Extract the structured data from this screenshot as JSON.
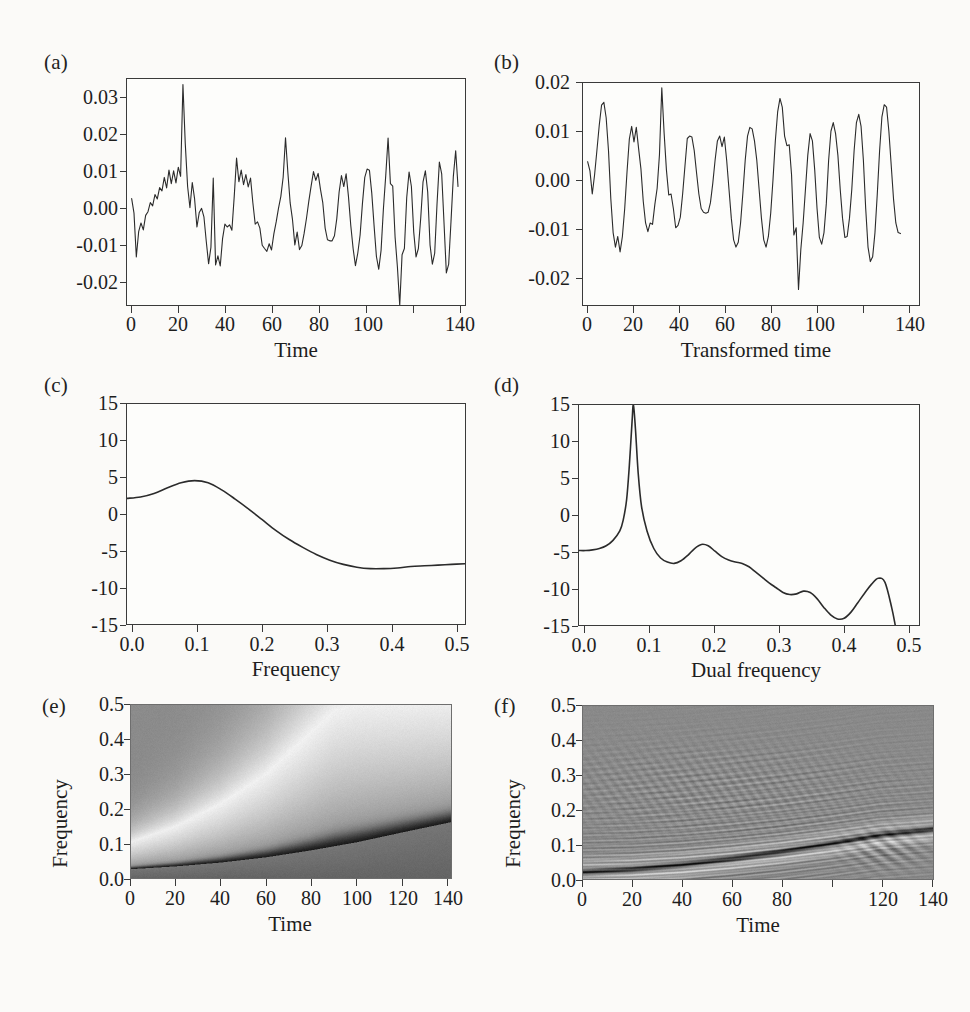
{
  "figure": {
    "background": "#fbfaf8",
    "ink": "#2a2a2a",
    "panel_count": 6
  },
  "panels": {
    "a": {
      "label": "(a)",
      "xlabel": "Time",
      "ylabel": "",
      "xticks": [
        "0",
        "20",
        "40",
        "60",
        "80",
        "100",
        "140"
      ],
      "yticks": [
        "0.03",
        "0.02",
        "0.01",
        "0.00",
        "-0.01",
        "-0.02"
      ]
    },
    "b": {
      "label": "(b)",
      "xlabel": "Transformed time",
      "ylabel": "",
      "xticks": [
        "0",
        "20",
        "40",
        "60",
        "80",
        "100",
        "140"
      ],
      "yticks": [
        "0.02",
        "0.01",
        "0.00",
        "-0.01",
        "-0.02"
      ]
    },
    "c": {
      "label": "(c)",
      "xlabel": "Frequency",
      "ylabel": "",
      "xticks": [
        "0.0",
        "0.1",
        "0.2",
        "0.3",
        "0.4",
        "0.5"
      ],
      "yticks": [
        "15",
        "10",
        "5",
        "0",
        "-5",
        "-10",
        "-15"
      ]
    },
    "d": {
      "label": "(d)",
      "xlabel": "Dual frequency",
      "ylabel": "",
      "xticks": [
        "0.0",
        "0.1",
        "0.2",
        "0.3",
        "0.4",
        "0.5"
      ],
      "yticks": [
        "15",
        "10",
        "5",
        "0",
        "-5",
        "-10",
        "-15"
      ]
    },
    "e": {
      "label": "(e)",
      "xlabel": "Time",
      "ylabel": "Frequency",
      "xticks": [
        "0",
        "20",
        "40",
        "60",
        "80",
        "100",
        "120",
        "140"
      ],
      "yticks": [
        "0.5",
        "0.4",
        "0.3",
        "0.2",
        "0.1",
        "0.0"
      ]
    },
    "f": {
      "label": "(f)",
      "xlabel": "Time",
      "ylabel": "Frequency",
      "xticks": [
        "0",
        "20",
        "40",
        "60",
        "80",
        "100",
        "120",
        "140"
      ],
      "yticks": [
        "0.5",
        "0.4",
        "0.3",
        "0.2",
        "0.1",
        "0.0"
      ]
    }
  },
  "chart_data": [
    {
      "panel": "a",
      "type": "line",
      "title": "(a)",
      "xlabel": "Time",
      "ylabel": "",
      "xlim": [
        0,
        145
      ],
      "ylim": [
        -0.026,
        0.036
      ],
      "grid": false,
      "legend": "none",
      "x": [
        2,
        3,
        4,
        5,
        6,
        7,
        8,
        9,
        10,
        11,
        12,
        13,
        14,
        15,
        16,
        17,
        18,
        19,
        20,
        21,
        22,
        23,
        24,
        25,
        26,
        27,
        28,
        29,
        30,
        31,
        32,
        33,
        34,
        35,
        36,
        37,
        38,
        39,
        40,
        41,
        42,
        43,
        44,
        45,
        46,
        47,
        48,
        49,
        50,
        51,
        52,
        53,
        54,
        55,
        56,
        57,
        58,
        59,
        60,
        61,
        62,
        63,
        64,
        65,
        66,
        67,
        68,
        69,
        70,
        71,
        72,
        73,
        74,
        75,
        76,
        77,
        78,
        79,
        80,
        81,
        82,
        83,
        84,
        85,
        86,
        87,
        88,
        89,
        90,
        91,
        92,
        93,
        94,
        95,
        96,
        97,
        98,
        99,
        100,
        101,
        102,
        103,
        104,
        105,
        106,
        107,
        108,
        109,
        110,
        111,
        112,
        113,
        114,
        115,
        116,
        117,
        118,
        119,
        120,
        121,
        122,
        123,
        124,
        125,
        126,
        127,
        128,
        129,
        130,
        131,
        132,
        133,
        134,
        135,
        136,
        137,
        138,
        139,
        140,
        141,
        142
      ],
      "y": [
        0.0032,
        -0.0008,
        -0.0128,
        -0.0059,
        -0.0035,
        -0.0054,
        -0.0014,
        -0.0004,
        0.0021,
        0.0012,
        0.0043,
        0.0031,
        0.0062,
        0.0053,
        0.009,
        0.0061,
        0.011,
        0.0073,
        0.0108,
        0.0075,
        0.0118,
        0.0093,
        0.0345,
        0.0182,
        0.0065,
        0.0007,
        0.0076,
        0.0031,
        -0.0046,
        -0.0006,
        0.0005,
        -0.0018,
        -0.0085,
        -0.0147,
        -0.0102,
        0.0088,
        -0.015,
        -0.0125,
        -0.0153,
        -0.0078,
        -0.0038,
        -0.0046,
        -0.004,
        -0.0055,
        0.0038,
        0.0143,
        0.0078,
        0.011,
        0.007,
        0.0098,
        0.0064,
        0.0088,
        0.002,
        -0.0038,
        -0.0032,
        -0.0049,
        -0.0096,
        -0.0105,
        -0.0113,
        -0.0092,
        -0.0109,
        -0.0065,
        -0.0032,
        0.0006,
        0.0038,
        0.0091,
        0.0199,
        0.0104,
        0.002,
        -0.0026,
        -0.0095,
        -0.006,
        -0.0108,
        -0.0097,
        -0.0063,
        -0.0022,
        0.0025,
        0.0067,
        0.0106,
        0.0082,
        0.0101,
        0.0057,
        0.002,
        -0.0049,
        -0.0081,
        -0.0084,
        -0.0084,
        -0.007,
        -0.0023,
        0.005,
        0.0095,
        0.0065,
        0.01,
        0.0038,
        -0.0042,
        -0.0105,
        -0.0152,
        -0.0118,
        -0.0068,
        0.0018,
        0.009,
        0.0113,
        0.011,
        0.0047,
        -0.0043,
        -0.0127,
        -0.0162,
        -0.011,
        0.0004,
        0.0095,
        0.0198,
        0.0073,
        0.0066,
        -0.0073,
        -0.0155,
        -0.0261,
        -0.0122,
        -0.0105,
        0.0035,
        0.0105,
        0.0065,
        -0.006,
        -0.0128,
        -0.0105,
        -0.0022,
        0.0078,
        0.0108,
        0.005,
        -0.0095,
        -0.0148,
        -0.0118,
        0.0018,
        0.0132,
        0.01,
        -0.0035,
        -0.0172,
        -0.0148,
        -0.003,
        0.0093,
        0.0163,
        0.0065,
        -0.0115
      ]
    },
    {
      "panel": "b",
      "type": "line",
      "title": "(b)",
      "xlabel": "Transformed time",
      "ylabel": "",
      "xlim": [
        0,
        145
      ],
      "ylim": [
        -0.026,
        0.02
      ],
      "grid": false,
      "legend": "none",
      "x": [
        2,
        3,
        4,
        5,
        6,
        7,
        8,
        9,
        10,
        11,
        12,
        13,
        14,
        15,
        16,
        17,
        18,
        19,
        20,
        21,
        22,
        23,
        24,
        25,
        26,
        27,
        28,
        29,
        30,
        31,
        32,
        33,
        34,
        35,
        36,
        37,
        38,
        39,
        40,
        41,
        42,
        43,
        44,
        45,
        46,
        47,
        48,
        49,
        50,
        51,
        52,
        53,
        54,
        55,
        56,
        57,
        58,
        59,
        60,
        61,
        62,
        63,
        64,
        65,
        66,
        67,
        68,
        69,
        70,
        71,
        72,
        73,
        74,
        75,
        76,
        77,
        78,
        79,
        80,
        81,
        82,
        83,
        84,
        85,
        86,
        87,
        88,
        89,
        90,
        91,
        92,
        93,
        94,
        95,
        96,
        97,
        98,
        99,
        100,
        101,
        102,
        103,
        104,
        105,
        106,
        107,
        108,
        109,
        110,
        111,
        112,
        113,
        114,
        115,
        116,
        117,
        118,
        119,
        120,
        121,
        122,
        123,
        124,
        125,
        126,
        127,
        128,
        129,
        130,
        131,
        132,
        133,
        134,
        135,
        136,
        137,
        138,
        139,
        140,
        141,
        142
      ],
      "y": [
        0.0037,
        0.0018,
        -0.003,
        0.001,
        0.006,
        0.0112,
        0.0154,
        0.016,
        0.0128,
        0.006,
        -0.004,
        -0.011,
        -0.014,
        -0.0118,
        -0.015,
        -0.0118,
        -0.006,
        0.0016,
        0.0084,
        0.011,
        0.0078,
        0.0108,
        0.0064,
        0.0022,
        -0.0045,
        -0.009,
        -0.0108,
        -0.009,
        -0.0093,
        -0.0052,
        -0.0018,
        0.0052,
        0.019,
        0.0097,
        0.002,
        -0.0032,
        -0.003,
        -0.006,
        -0.01,
        -0.0095,
        -0.0078,
        -0.003,
        0.0028,
        0.0085,
        0.009,
        0.0088,
        0.006,
        0.0014,
        -0.003,
        -0.006,
        -0.0068,
        -0.007,
        -0.0068,
        -0.0048,
        -0.0008,
        0.004,
        0.008,
        0.009,
        0.0068,
        0.0088,
        0.004,
        -0.002,
        -0.008,
        -0.0125,
        -0.014,
        -0.013,
        -0.009,
        -0.0028,
        0.004,
        0.009,
        0.0108,
        0.0105,
        0.008,
        0.004,
        -0.002,
        -0.008,
        -0.0125,
        -0.014,
        -0.0118,
        -0.007,
        0.0,
        0.008,
        0.014,
        0.0168,
        0.015,
        0.009,
        0.007,
        0.0072,
        0.001,
        -0.0115,
        -0.01,
        -0.0228,
        -0.0145,
        -0.009,
        -0.002,
        0.005,
        0.0095,
        0.008,
        0.002,
        -0.006,
        -0.012,
        -0.0134,
        -0.011,
        -0.005,
        0.004,
        0.01,
        0.0118,
        0.0095,
        0.005,
        -0.002,
        -0.008,
        -0.012,
        -0.0118,
        -0.008,
        -0.002,
        0.006,
        0.0118,
        0.0135,
        0.011,
        0.004,
        -0.006,
        -0.014,
        -0.017,
        -0.016,
        -0.011,
        -0.003,
        0.006,
        0.013,
        0.0155,
        0.015,
        0.01,
        0.003,
        -0.004,
        -0.009,
        -0.011,
        -0.0112
      ]
    },
    {
      "panel": "c",
      "type": "line",
      "title": "(c)",
      "xlabel": "Frequency",
      "ylabel": "",
      "xlim": [
        0.0,
        0.5
      ],
      "ylim": [
        -15,
        16
      ],
      "grid": false,
      "legend": "none",
      "x": [
        0.0,
        0.02,
        0.04,
        0.06,
        0.08,
        0.1,
        0.12,
        0.14,
        0.16,
        0.18,
        0.2,
        0.22,
        0.24,
        0.26,
        0.28,
        0.3,
        0.32,
        0.34,
        0.36,
        0.38,
        0.4,
        0.42,
        0.44,
        0.46,
        0.48,
        0.5
      ],
      "y": [
        2.7,
        2.9,
        3.4,
        4.2,
        4.9,
        5.2,
        4.9,
        3.9,
        2.6,
        1.2,
        -0.3,
        -1.8,
        -3.1,
        -4.2,
        -5.2,
        -6.0,
        -6.6,
        -7.0,
        -7.2,
        -7.2,
        -7.1,
        -6.9,
        -6.8,
        -6.7,
        -6.6,
        -6.5
      ]
    },
    {
      "panel": "d",
      "type": "line",
      "title": "(d)",
      "xlabel": "Dual frequency",
      "ylabel": "",
      "xlim": [
        0.0,
        0.5
      ],
      "ylim": [
        -16.5,
        16
      ],
      "grid": false,
      "legend": "none",
      "x": [
        0.0,
        0.01,
        0.02,
        0.03,
        0.04,
        0.05,
        0.06,
        0.065,
        0.07,
        0.074,
        0.078,
        0.08,
        0.083,
        0.087,
        0.092,
        0.1,
        0.11,
        0.12,
        0.13,
        0.14,
        0.15,
        0.16,
        0.17,
        0.18,
        0.19,
        0.2,
        0.21,
        0.22,
        0.23,
        0.24,
        0.25,
        0.26,
        0.27,
        0.28,
        0.29,
        0.3,
        0.31,
        0.32,
        0.33,
        0.34,
        0.35,
        0.36,
        0.37,
        0.38,
        0.39,
        0.4,
        0.41,
        0.42,
        0.43,
        0.44,
        0.45,
        0.46,
        0.465
      ],
      "y": [
        -5.5,
        -5.5,
        -5.4,
        -5.2,
        -4.8,
        -4.0,
        -2.6,
        -1.0,
        2.0,
        7.0,
        13.5,
        16.0,
        12.5,
        6.0,
        1.0,
        -2.6,
        -5.2,
        -6.6,
        -7.2,
        -7.4,
        -7.0,
        -6.2,
        -5.2,
        -4.6,
        -4.8,
        -5.6,
        -6.4,
        -6.9,
        -7.2,
        -7.4,
        -7.9,
        -8.7,
        -9.5,
        -10.3,
        -11.0,
        -11.7,
        -12.0,
        -11.9,
        -11.5,
        -11.7,
        -12.6,
        -13.9,
        -15.0,
        -15.6,
        -15.5,
        -14.6,
        -13.2,
        -11.8,
        -10.5,
        -9.6,
        -10.2,
        -14.0,
        -16.5
      ]
    },
    {
      "panel": "e",
      "type": "heatmap",
      "title": "(e)",
      "xlabel": "Time",
      "ylabel": "Frequency",
      "xlim": [
        0,
        142
      ],
      "ylim": [
        0.0,
        0.5
      ],
      "colormap": "grayscale",
      "description": "time-varying spectrum; dark ridge rises from 0.03 at t=0 to 0.16 at t=142; light lobe expands upward to the right",
      "ridge": {
        "t": [
          0,
          20,
          40,
          60,
          80,
          100,
          120,
          142
        ],
        "frequency": [
          0.028,
          0.036,
          0.047,
          0.062,
          0.082,
          0.105,
          0.133,
          0.163
        ]
      },
      "upper_edge": {
        "t": [
          0,
          20,
          40,
          60,
          80,
          90,
          100
        ],
        "frequency": [
          0.105,
          0.15,
          0.215,
          0.3,
          0.42,
          0.48,
          0.5
        ]
      }
    },
    {
      "panel": "f",
      "type": "heatmap",
      "title": "(f)",
      "xlabel": "Time",
      "ylabel": "Frequency",
      "xlim": [
        0,
        142
      ],
      "ylim": [
        0.0,
        0.5
      ],
      "colormap": "grayscale",
      "description": "Wigner-Ville style distribution; mid-gray field with oscillatory interference speckle; sharp dark instantaneous-frequency ridge rising from 0.02 to 0.14",
      "ridge": {
        "t": [
          0,
          20,
          40,
          60,
          80,
          100,
          120,
          142
        ],
        "frequency": [
          0.022,
          0.03,
          0.043,
          0.06,
          0.08,
          0.103,
          0.128,
          0.145
        ]
      }
    }
  ],
  "showthrough": {
    "note": "faint reverse-side print visible on scanned page",
    "items": [
      "FIGURE",
      "(a)",
      "(b)",
      "(c)",
      "(d)"
    ]
  }
}
